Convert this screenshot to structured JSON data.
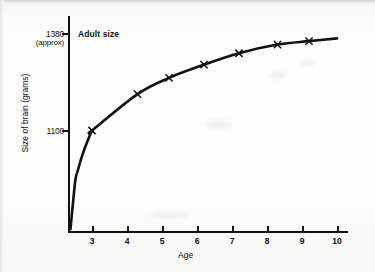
{
  "chart_data": {
    "type": "line",
    "title": "",
    "xlabel": "Age",
    "ylabel": "Size of brain (grams)",
    "annotation": "Adult size",
    "grid": false,
    "legend": "none",
    "xlim": [
      0,
      10
    ],
    "ylim": [
      0,
      1460
    ],
    "xticks": [
      3,
      4,
      5,
      6,
      7,
      8,
      9,
      10
    ],
    "xtick_labels": [
      "3",
      "4",
      "5",
      "6",
      "7",
      "8",
      "9",
      "10"
    ],
    "yticks": [
      1100,
      1380
    ],
    "ytick_labels": [
      "1100",
      "1380"
    ],
    "ytick_sublabel": "(approx)",
    "adult_size_value": 1380,
    "marker_symbol": "x",
    "curve_color": "#111111",
    "points": [
      {
        "x": 3.0,
        "y": 1100
      },
      {
        "x": 4.3,
        "y": 1205
      },
      {
        "x": 5.2,
        "y": 1252
      },
      {
        "x": 6.2,
        "y": 1290
      },
      {
        "x": 7.2,
        "y": 1323
      },
      {
        "x": 8.3,
        "y": 1348
      },
      {
        "x": 9.2,
        "y": 1358
      }
    ],
    "series": [
      {
        "name": "Brain size",
        "x": [
          3.0,
          4.3,
          5.2,
          6.2,
          7.2,
          8.3,
          9.2
        ],
        "values": [
          1100,
          1205,
          1252,
          1290,
          1323,
          1348,
          1358
        ]
      }
    ]
  },
  "axes": {
    "y_title": "Size of brain (grams)",
    "x_title": "Age",
    "y_top_label": "1380",
    "y_top_sublabel": "(approx)",
    "y_bottom_label": "1100",
    "x_tick_labels": [
      "3",
      "4",
      "5",
      "6",
      "7",
      "8",
      "9",
      "10"
    ]
  },
  "annotations": {
    "adult_size": "Adult size"
  }
}
